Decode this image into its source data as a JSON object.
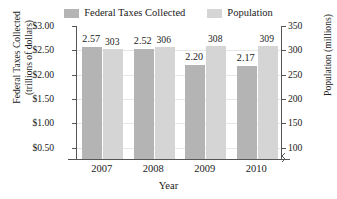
{
  "chart_data": {
    "type": "bar",
    "title": "",
    "xlabel": "Year",
    "categories": [
      "2007",
      "2008",
      "2009",
      "2010"
    ],
    "grid": true,
    "legend_position": "top-center",
    "series": [
      {
        "name": "Federal Taxes Collected",
        "axis": "left",
        "color": "#b4b4b4",
        "values": [
          2.57,
          2.52,
          2.2,
          2.17
        ],
        "labels": [
          "2.57",
          "2.52",
          "2.20",
          "2.17"
        ]
      },
      {
        "name": "Population",
        "axis": "right",
        "color": "#d5d5d5",
        "values": [
          303,
          306,
          308,
          309
        ],
        "labels": [
          "303",
          "306",
          "308",
          "309"
        ]
      }
    ],
    "axes": {
      "left": {
        "label_line1": "Federal Taxes Collected",
        "label_line2": "(trillions of dollars)",
        "ticks": [
          "$3.00",
          "$2.50",
          "$2.00",
          "$1.50",
          "$1.00",
          "$0.50"
        ],
        "tick_values": [
          3.0,
          2.5,
          2.0,
          1.5,
          1.0,
          0.5
        ],
        "ylim": [
          0.25,
          3.0
        ],
        "broken": true
      },
      "right": {
        "label": "Population (millions)",
        "ticks": [
          "350",
          "300",
          "250",
          "200",
          "150",
          "100"
        ],
        "tick_values": [
          350,
          300,
          250,
          200,
          150,
          100
        ],
        "ylim": [
          75,
          350
        ],
        "broken": true
      }
    }
  },
  "legend": {
    "items": [
      {
        "label": "Federal Taxes Collected",
        "color": "#b4b4b4"
      },
      {
        "label": "Population",
        "color": "#d5d5d5"
      }
    ]
  }
}
